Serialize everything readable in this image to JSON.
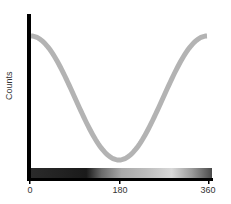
{
  "chart_data": {
    "type": "line",
    "title": "",
    "xlabel": "",
    "ylabel": "Counts",
    "x_ticks": [
      "0",
      "180",
      "360"
    ],
    "xlim": [
      0,
      360
    ],
    "ylim": [
      0,
      1
    ],
    "grid": false,
    "legend": null,
    "series": [
      {
        "name": "counts",
        "color": "#b3b3b3",
        "x": [
          0,
          30,
          60,
          90,
          120,
          150,
          180,
          210,
          240,
          270,
          300,
          330,
          360
        ],
        "values": [
          1.0,
          0.97,
          0.88,
          0.75,
          0.5,
          0.25,
          0.0,
          0.25,
          0.5,
          0.75,
          0.88,
          0.97,
          1.0
        ]
      }
    ],
    "colorbar": {
      "description": "grayscale intensity strip along x-axis",
      "stops": [
        {
          "x": 0,
          "color": "#2a2a2a"
        },
        {
          "x": 60,
          "color": "#222222"
        },
        {
          "x": 110,
          "color": "#1a1a1a"
        },
        {
          "x": 140,
          "color": "#6a6a6a"
        },
        {
          "x": 180,
          "color": "#a8a8a8"
        },
        {
          "x": 230,
          "color": "#bdbdbd"
        },
        {
          "x": 280,
          "color": "#d8d8d8"
        },
        {
          "x": 320,
          "color": "#9a9a9a"
        },
        {
          "x": 360,
          "color": "#4a4a4a"
        }
      ]
    }
  },
  "labels": {
    "ylabel": "Counts",
    "tick_0": "0",
    "tick_180": "180",
    "tick_360": "360"
  }
}
